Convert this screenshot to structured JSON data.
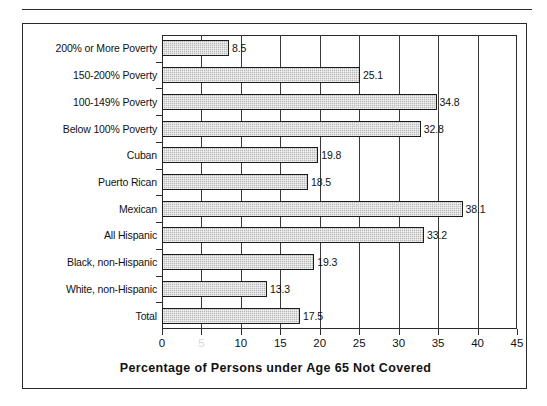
{
  "figure": {
    "frame_color": "#2b2b2b",
    "background": "#ffffff"
  },
  "chart_data": {
    "type": "bar",
    "orientation": "horizontal",
    "title": "",
    "subtitle": "",
    "xlabel": "Percentage of Persons under Age 65 Not Covered",
    "ylabel": "",
    "xlim": [
      0,
      45
    ],
    "xticks": [
      0,
      5,
      10,
      15,
      20,
      25,
      30,
      35,
      40,
      45
    ],
    "xticklabels": [
      "0",
      "5",
      "10",
      "15",
      "20",
      "25",
      "30",
      "35",
      "40",
      "45"
    ],
    "grid": true,
    "grid_axis": "x",
    "legend": null,
    "bar_fill": "#b8b8b8",
    "bar_edge": "#1c1c1c",
    "categories": [
      "200% or More Poverty",
      "150-200% Poverty",
      "100-149% Poverty",
      "Below 100% Poverty",
      "Cuban",
      "Puerto Rican",
      "Mexican",
      "All Hispanic",
      "Black, non-Hispanic",
      "White, non-Hispanic",
      "Total"
    ],
    "values": [
      8.5,
      25.1,
      34.8,
      32.8,
      19.8,
      18.5,
      38.1,
      33.2,
      19.3,
      13.3,
      17.5
    ],
    "value_labels": [
      "8.5",
      "25.1",
      "34.8",
      "32.8",
      "19.8",
      "18.5",
      "38.1",
      "33.2",
      "19.3",
      "13.3",
      "17.5"
    ]
  }
}
